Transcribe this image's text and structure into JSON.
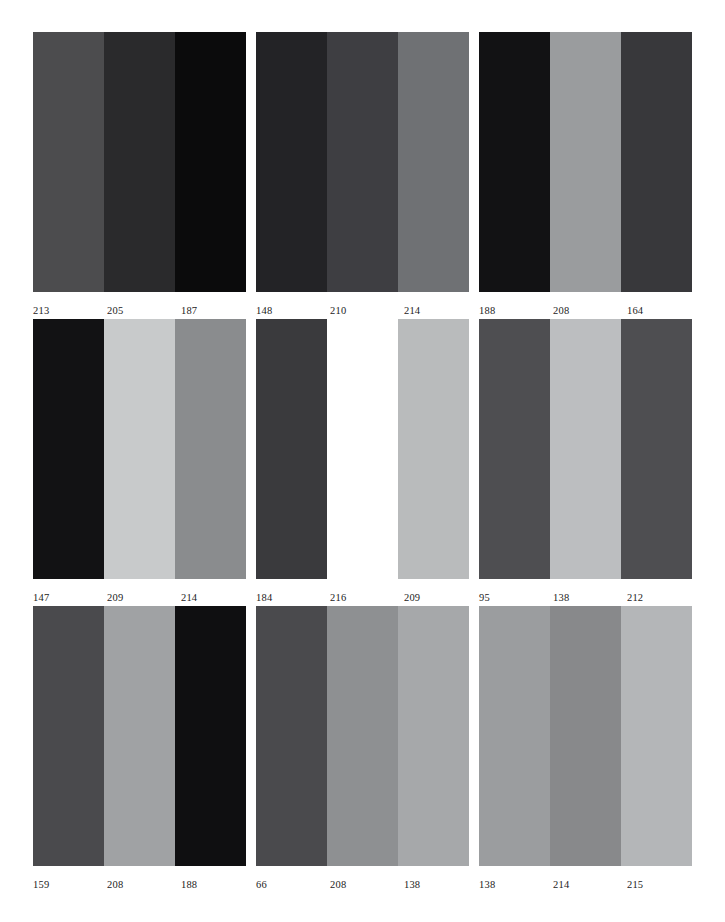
{
  "page": {
    "background": "#ffffff",
    "rows": 3,
    "columns": 3
  },
  "chart_data": {
    "type": "heatmap",
    "xlabel": "",
    "ylabel": "",
    "grid": false,
    "legend": "none",
    "panels": [
      {
        "index": 1,
        "row": 1,
        "column": 1,
        "labels": [
          "213",
          "205",
          "187"
        ],
        "values": [
          213,
          205,
          187
        ],
        "colors": [
          "#4c4c4e",
          "#2a2a2c",
          "#0b0b0c"
        ]
      },
      {
        "index": 2,
        "row": 1,
        "column": 2,
        "labels": [
          "148",
          "210",
          "214"
        ],
        "values": [
          148,
          210,
          214
        ],
        "colors": [
          "#232326",
          "#3e3e42",
          "#6f7174"
        ]
      },
      {
        "index": 3,
        "row": 1,
        "column": 3,
        "labels": [
          "188",
          "208",
          "164"
        ],
        "values": [
          188,
          208,
          164
        ],
        "colors": [
          "#121214",
          "#9a9c9e",
          "#38383b"
        ]
      },
      {
        "index": 4,
        "row": 2,
        "column": 1,
        "labels": [
          "147",
          "209",
          "214"
        ],
        "values": [
          147,
          209,
          214
        ],
        "colors": [
          "#121214",
          "#c8cacb",
          "#8a8c8e"
        ]
      },
      {
        "index": 5,
        "row": 2,
        "column": 2,
        "labels": [
          "184",
          "216",
          "209"
        ],
        "values": [
          184,
          216,
          209
        ],
        "colors": [
          "#3a3a3d",
          "#ffffff",
          "#b9bbbc"
        ]
      },
      {
        "index": 6,
        "row": 2,
        "column": 3,
        "labels": [
          "95",
          "138",
          "212"
        ],
        "values": [
          95,
          138,
          212
        ],
        "colors": [
          "#4e4e51",
          "#bcbec0",
          "#4e4e51"
        ]
      },
      {
        "index": 7,
        "row": 3,
        "column": 1,
        "labels": [
          "159",
          "208",
          "188"
        ],
        "values": [
          159,
          208,
          188
        ],
        "colors": [
          "#4a4a4d",
          "#a0a2a4",
          "#0f0f11"
        ]
      },
      {
        "index": 8,
        "row": 3,
        "column": 2,
        "labels": [
          "66",
          "208",
          "138"
        ],
        "values": [
          66,
          208,
          138
        ],
        "colors": [
          "#4a4a4d",
          "#8e9092",
          "#a6a8aa"
        ]
      },
      {
        "index": 9,
        "row": 3,
        "column": 3,
        "labels": [
          "138",
          "214",
          "215"
        ],
        "values": [
          138,
          214,
          215
        ],
        "colors": [
          "#9b9d9f",
          "#88898b",
          "#b4b6b8"
        ]
      }
    ]
  }
}
